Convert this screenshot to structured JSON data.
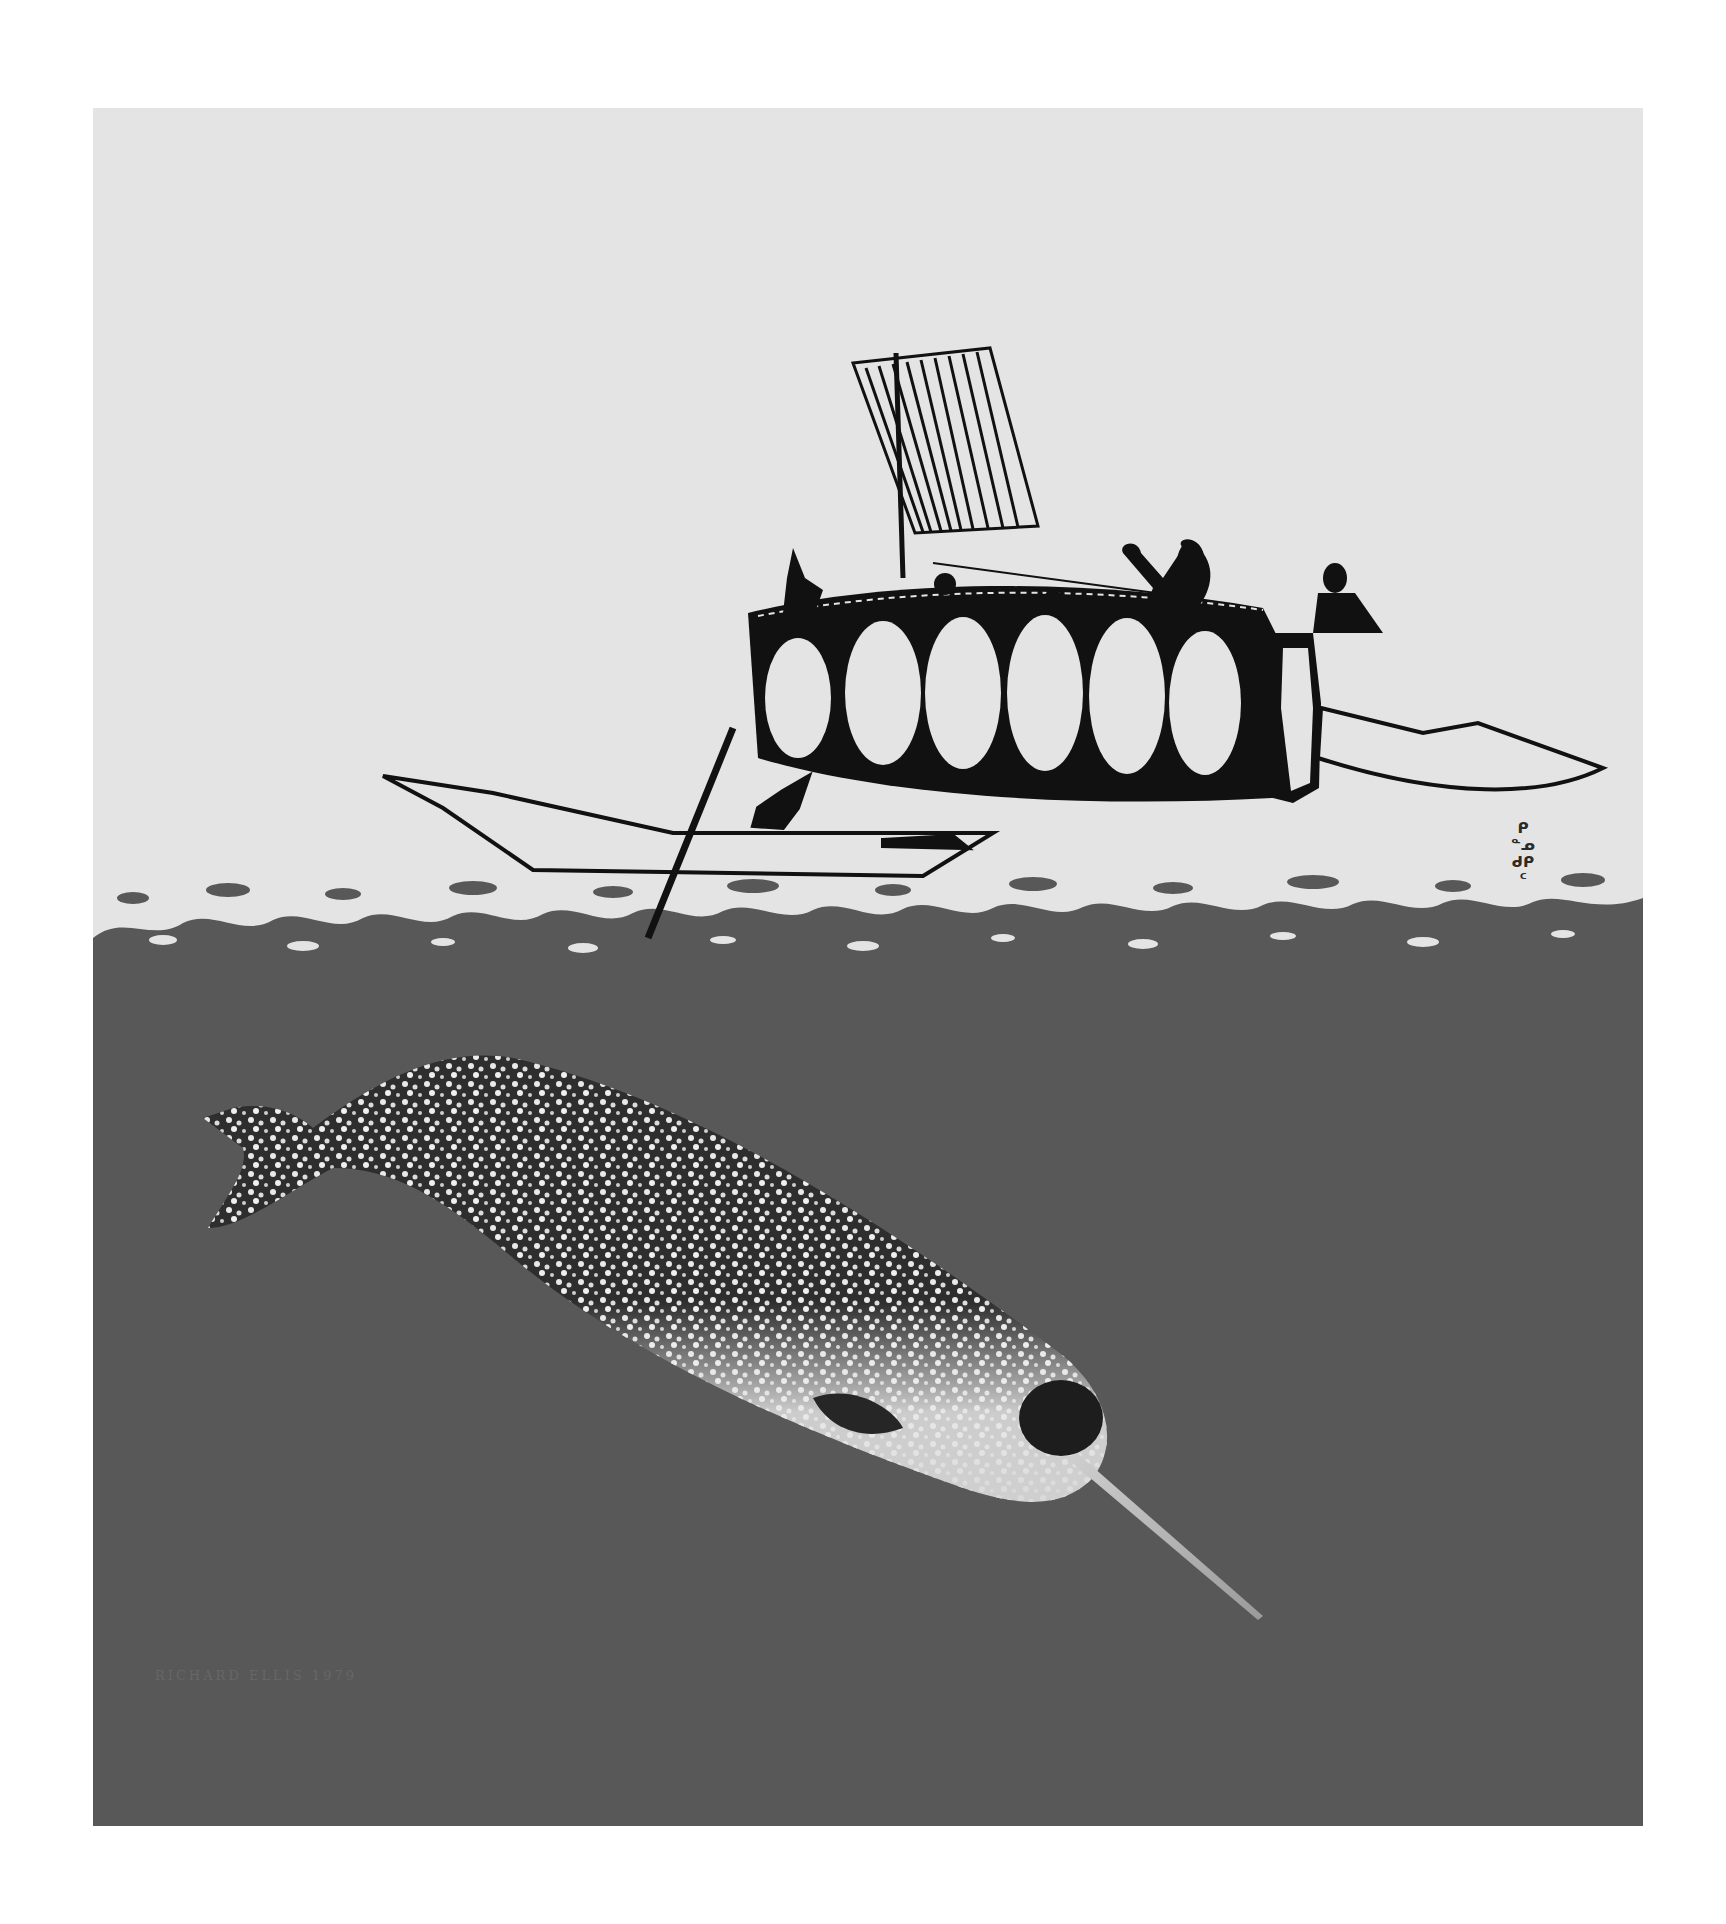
{
  "artwork": {
    "description": "Print of an umiak with sail and a kayaker above the water, with a narwhal swimming below the surface",
    "colors": {
      "paper": "#ffffff",
      "sky": "#e4e4e4",
      "sea": "#585858",
      "ink": "#111111",
      "narwhal_light": "#e8e8e8",
      "narwhal_dark": "#2a2a2a"
    },
    "signature": "RICHARD ELLIS 1979",
    "syllabics": [
      "ᑭ",
      "ᓐᓄ",
      "ᑯᑭ",
      "ᑦ"
    ]
  }
}
